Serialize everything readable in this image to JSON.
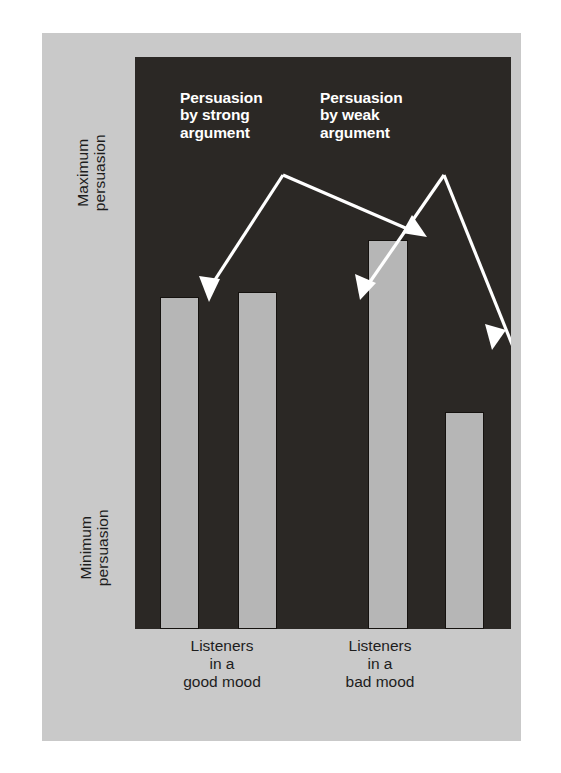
{
  "figure": {
    "background_color": "#ffffff",
    "panel_color": "#c9c9c9",
    "plot_background_color": "#2b2825",
    "bar_color": "#b6b6b6",
    "bar_outline_color": "#15120f",
    "annotation_color": "#ffffff",
    "axis_text_color": "#1d1d1d"
  },
  "y_axis": {
    "max_label_line1": "Maximum",
    "max_label_line2": "persuasion",
    "min_label_line1": "Minimum",
    "min_label_line2": "persuasion"
  },
  "x_axis": {
    "good_mood_line1": "Listeners",
    "good_mood_line2": "in a",
    "good_mood_line3": "good mood",
    "bad_mood_line1": "Listeners",
    "bad_mood_line2": "in a",
    "bad_mood_line3": "bad mood"
  },
  "annotations": {
    "strong_line1": "Persuasion",
    "strong_line2": "by strong",
    "strong_line3": "argument",
    "weak_line1": "Persuasion",
    "weak_line2": "by weak",
    "weak_line3": "argument"
  },
  "chart_data": {
    "type": "bar",
    "title": "",
    "subtitle": "",
    "xlabel": "",
    "ylabel": "Persuasion",
    "ylim": [
      0,
      100
    ],
    "grid": false,
    "legend_position": "in-plot-annotations",
    "categories": [
      "Listeners in a good mood",
      "Listeners in a bad mood"
    ],
    "y_tick_labels": [
      "Minimum persuasion",
      "Maximum persuasion"
    ],
    "series": [
      {
        "name": "Persuasion by strong argument",
        "values": [
          58,
          68
        ]
      },
      {
        "name": "Persuasion by weak argument",
        "values": [
          59,
          38
        ]
      }
    ],
    "bars": [
      {
        "group": "Listeners in a good mood",
        "series": "Persuasion by strong argument",
        "value": 58
      },
      {
        "group": "Listeners in a good mood",
        "series": "Persuasion by weak argument",
        "value": 59
      },
      {
        "group": "Listeners in a bad mood",
        "series": "Persuasion by strong argument",
        "value": 68
      },
      {
        "group": "Listeners in a bad mood",
        "series": "Persuasion by weak argument",
        "value": 38
      }
    ],
    "annotations": [
      {
        "text": "Persuasion by strong argument",
        "points_to": [
          "bar-1",
          "bar-3"
        ]
      },
      {
        "text": "Persuasion by weak argument",
        "points_to": [
          "bar-2",
          "bar-4"
        ]
      }
    ]
  }
}
